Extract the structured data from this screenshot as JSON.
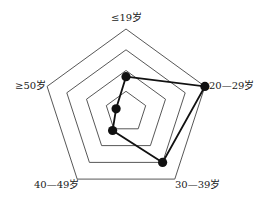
{
  "chart_data": {
    "type": "radar",
    "title": "",
    "categories": [
      "≤19岁",
      "20—29岁",
      "30—39岁",
      "40—49岁",
      "≥50岁"
    ],
    "series": [
      {
        "name": "",
        "values": [
          1.7,
          4,
          3,
          1.1,
          0.5
        ]
      }
    ],
    "rings": 4,
    "rlim": [
      0,
      4
    ],
    "grid": true,
    "legend": "none"
  },
  "style": {
    "grid_color": "#444444",
    "series_color": "#111111",
    "label_color": "#222222"
  },
  "labels": {
    "top": "≤19岁",
    "right": "20—29岁",
    "bottom_right": "30—39岁",
    "bottom_left": "40—49岁",
    "left": "≥50岁"
  }
}
